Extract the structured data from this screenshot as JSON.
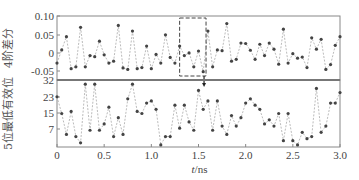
{
  "chart_data": [
    {
      "type": "line",
      "panel": "top",
      "ylabel": "4阶差分",
      "ylim": [
        -0.07,
        0.1
      ],
      "yticks": [
        "0.10",
        "0.05",
        "0",
        "-0.05"
      ],
      "x": [
        0,
        0.05,
        0.1,
        0.15,
        0.2,
        0.25,
        0.3,
        0.35,
        0.4,
        0.45,
        0.5,
        0.55,
        0.6,
        0.65,
        0.7,
        0.75,
        0.8,
        0.85,
        0.9,
        0.95,
        1.0,
        1.05,
        1.1,
        1.15,
        1.2,
        1.25,
        1.3,
        1.35,
        1.4,
        1.45,
        1.5,
        1.55,
        1.6,
        1.65,
        1.7,
        1.75,
        1.8,
        1.85,
        1.9,
        1.95,
        2.0,
        2.05,
        2.1,
        2.15,
        2.2,
        2.25,
        2.3,
        2.35,
        2.4,
        2.45,
        2.5,
        2.55,
        2.6,
        2.65,
        2.7,
        2.75,
        2.8,
        2.85,
        2.9,
        2.95,
        3.0
      ],
      "values": [
        -0.025,
        0.01,
        0.045,
        -0.04,
        -0.035,
        0.07,
        -0.035,
        -0.005,
        -0.008,
        0.033,
        -0.003,
        -0.025,
        -0.02,
        0.075,
        -0.038,
        -0.042,
        0.06,
        -0.04,
        -0.037,
        0.02,
        -0.04,
        -0.002,
        -0.025,
        0.05,
        -0.01,
        -0.025,
        0.02,
        -0.005,
        0.002,
        -0.035,
        0.007,
        -0.048,
        0.06,
        -0.035,
        0.01,
        0.008,
        0.08,
        -0.02,
        -0.015,
        0.028,
        0.027,
        0.009,
        -0.015,
        0.025,
        -0.005,
        0.028,
        0.012,
        -0.028,
        0.065,
        -0.025,
        0.0,
        -0.012,
        -0.009,
        -0.037,
        0.042,
        0.012,
        0.038,
        -0.042,
        -0.029,
        0.022,
        0.045
      ],
      "annotation": {
        "type": "dashed-box",
        "x_range": [
          1.3,
          1.58
        ]
      }
    },
    {
      "type": "line",
      "panel": "bottom",
      "ylabel": "5位最低有效位",
      "ylim": [
        0,
        32
      ],
      "yticks": [
        "32",
        "23",
        "15",
        "7"
      ],
      "x": [
        0,
        0.05,
        0.1,
        0.15,
        0.2,
        0.25,
        0.3,
        0.35,
        0.4,
        0.45,
        0.5,
        0.55,
        0.6,
        0.65,
        0.7,
        0.75,
        0.8,
        0.85,
        0.9,
        0.95,
        1.0,
        1.05,
        1.1,
        1.15,
        1.2,
        1.25,
        1.3,
        1.35,
        1.4,
        1.45,
        1.5,
        1.55,
        1.6,
        1.65,
        1.7,
        1.75,
        1.8,
        1.85,
        1.9,
        1.95,
        2.0,
        2.05,
        2.1,
        2.15,
        2.2,
        2.25,
        2.3,
        2.35,
        2.4,
        2.45,
        2.5,
        2.55,
        2.6,
        2.65,
        2.7,
        2.75,
        2.8,
        2.85,
        2.9,
        2.95,
        3.0
      ],
      "values": [
        24,
        16,
        6,
        17,
        5,
        2,
        30,
        8,
        30,
        8,
        11,
        19,
        5,
        14,
        6,
        23,
        30,
        17,
        16,
        21,
        22,
        18,
        1,
        5,
        5,
        20,
        9,
        20,
        12,
        8,
        27,
        18,
        22,
        8,
        22,
        10,
        6,
        15,
        10,
        14,
        21,
        23,
        20,
        18,
        11,
        13,
        10,
        16,
        3,
        16,
        3,
        1,
        7,
        4,
        5,
        28,
        7,
        10,
        21,
        21,
        26
      ]
    }
  ],
  "axes": {
    "xlabel": "t/ns",
    "xticks": [
      "0",
      "0.5",
      "1.0",
      "1.5",
      "2.0",
      "2.5",
      "3.0"
    ],
    "xlim": [
      0,
      3.0
    ]
  }
}
